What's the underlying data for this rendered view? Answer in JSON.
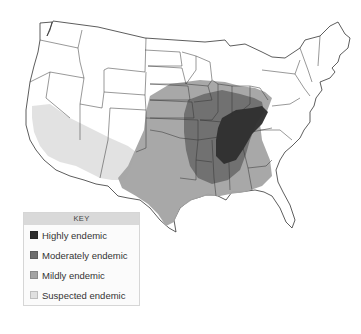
{
  "map": {
    "region": "Contiguous United States",
    "state_borders": true,
    "zones": [
      {
        "id": "suspected",
        "label": "Suspected endemic",
        "color": "#e0e0e0",
        "area": "Southern California, southern Nevada, Arizona, southern New Mexico"
      },
      {
        "id": "mildly",
        "label": "Mildly endemic",
        "color": "#a3a3a3",
        "area": "Texas, Oklahoma, Kansas, Nebraska, Iowa, Missouri, Arkansas, Louisiana, Mississippi, Alabama, Georgia, Ohio, West Virginia"
      },
      {
        "id": "moderately",
        "label": "Moderately endemic",
        "color": "#6e6e6e",
        "area": "Eastern Kansas/Oklahoma, Missouri, Illinois, Indiana, Arkansas, western Tennessee/Kentucky"
      },
      {
        "id": "highly",
        "label": "Highly endemic",
        "color": "#2e2e2e",
        "area": "Ohio and Mississippi river valleys: southern Illinois/Indiana, Kentucky, Tennessee, northern Mississippi"
      }
    ]
  },
  "legend": {
    "title": "KEY",
    "items": [
      {
        "label": "Highly endemic",
        "color": "#2e2e2e"
      },
      {
        "label": "Moderately endemic",
        "color": "#6e6e6e"
      },
      {
        "label": "Mildly endemic",
        "color": "#a3a3a3"
      },
      {
        "label": "Suspected endemic",
        "color": "#e0e0e0"
      }
    ]
  }
}
